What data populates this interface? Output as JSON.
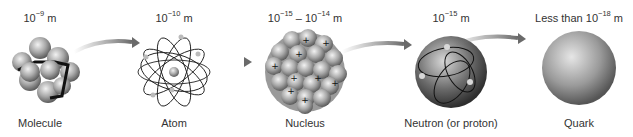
{
  "items": [
    {
      "name": "Molecule",
      "scale_prefix": "10",
      "scale_exp": "−9",
      "scale_suffix": " m"
    },
    {
      "name": "Atom",
      "scale_prefix": "10",
      "scale_exp": "−10",
      "scale_suffix": " m"
    },
    {
      "name": "Nucleus",
      "scale_prefix": "10",
      "scale_exp": "−15",
      "scale_mid": " – 10",
      "scale_exp2": "−14",
      "scale_suffix": " m"
    },
    {
      "name": "Neutron (or proton)",
      "scale_prefix": "10",
      "scale_exp": "−15",
      "scale_suffix": " m"
    },
    {
      "name": "Quark",
      "scale_lead": "Less than ",
      "scale_prefix": "10",
      "scale_exp": "−18",
      "scale_suffix": " m"
    }
  ],
  "colors": {
    "arrow": "#7a7a7a",
    "sphere_light": "#e0e0e0",
    "sphere_dark": "#707070",
    "text": "#333333"
  }
}
